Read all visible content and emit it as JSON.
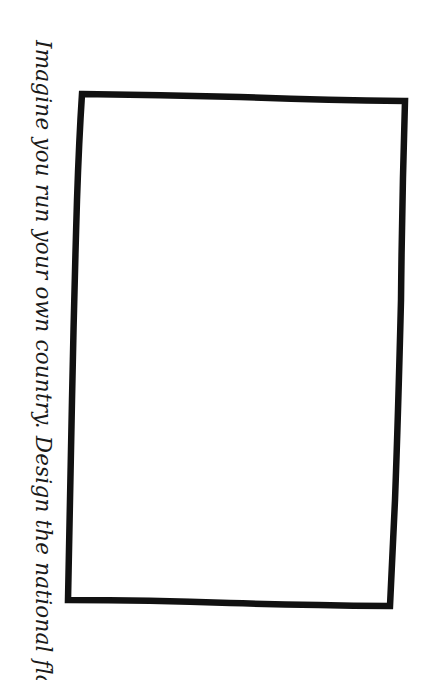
{
  "worksheet": {
    "prompt": "Imagine you run your own country. Design the national flag.",
    "prompt_orientation": "rotated-90-clockwise",
    "flag_box": {
      "state": "empty",
      "border_color": "#111111",
      "fill_color": "#ffffff"
    }
  }
}
